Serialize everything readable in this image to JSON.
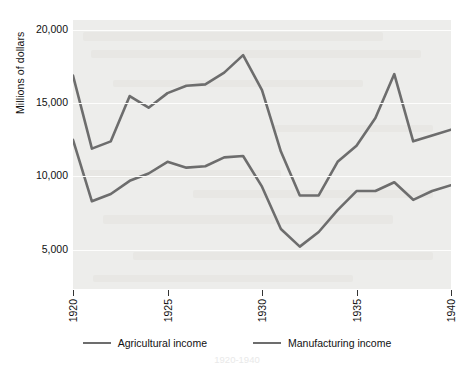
{
  "chart_data": {
    "type": "line",
    "title": "",
    "xlabel": "",
    "ylabel": "Millions of dollars",
    "xlim": [
      1920,
      1940
    ],
    "ylim": [
      2300,
      20700
    ],
    "grid": true,
    "legend_position": "bottom",
    "y_ticks": [
      "20,000",
      "15,000",
      "10,000",
      "5,000"
    ],
    "y_tick_values": [
      20000,
      15000,
      10000,
      5000
    ],
    "x_ticks": [
      "1920",
      "1925",
      "1930",
      "1935",
      "1940"
    ],
    "x_tick_values": [
      1920,
      1925,
      1930,
      1935,
      1940
    ],
    "x": [
      1920,
      1921,
      1922,
      1923,
      1924,
      1925,
      1926,
      1927,
      1928,
      1929,
      1930,
      1931,
      1932,
      1933,
      1934,
      1935,
      1936,
      1937,
      1938,
      1939,
      1940
    ],
    "series": [
      {
        "name": "Agricultural income",
        "color": "#6d6d6d",
        "values": [
          12500,
          8300,
          8800,
          9700,
          10200,
          11000,
          10600,
          10700,
          11300,
          11400,
          9300,
          6400,
          5200,
          6200,
          7700,
          9000,
          9000,
          9600,
          8400,
          9000,
          9400
        ]
      },
      {
        "name": "Manufacturing income",
        "color": "#6d6d6d",
        "values": [
          16900,
          11900,
          12400,
          15500,
          14700,
          15700,
          16200,
          16300,
          17100,
          18300,
          15900,
          11700,
          8700,
          8700,
          11000,
          12100,
          14000,
          17000,
          12400,
          12800,
          13200
        ]
      }
    ]
  },
  "legend": {
    "items": [
      {
        "label": "Agricultural income"
      },
      {
        "label": "Manufacturing income"
      }
    ]
  },
  "caption": {
    "text": "1920-1940"
  },
  "colors": {
    "line": "#6d6d6d",
    "plot_background": "#ededeb",
    "gridline": "#fdfdfc",
    "page_background": "#ffffff",
    "text": "#111111"
  }
}
